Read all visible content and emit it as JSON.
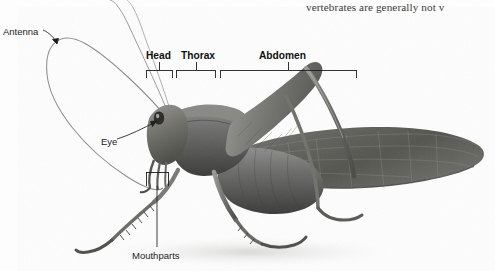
{
  "figure": {
    "background_color": "#fefefe",
    "ink_color": "#1d1d1d"
  },
  "caption": {
    "text": "vertebrates are generally not v",
    "note_clipped_right_edge": true
  },
  "labels": {
    "antenna": "Antenna",
    "eye": "Eye",
    "mouthparts": "Mouthparts",
    "head": "Head",
    "thorax": "Thorax",
    "abdomen": "Abdomen"
  },
  "brackets": [
    {
      "name": "head",
      "label": "Head",
      "x_start": 146,
      "x_end": 172,
      "y": 70,
      "tick_x": 159
    },
    {
      "name": "thorax",
      "label": "Thorax",
      "x_start": 176,
      "x_end": 215,
      "y": 70,
      "tick_x": 196
    },
    {
      "name": "abdomen",
      "label": "Abdomen",
      "x_start": 220,
      "x_end": 356,
      "y": 70,
      "tick_x": 288
    },
    {
      "name": "mouthparts-region",
      "label": "",
      "x_start": 146,
      "x_end": 168,
      "y": 172,
      "tick_x": 157
    }
  ],
  "leaders": [
    {
      "name": "antenna-arrow",
      "from_x": 44,
      "from_y": 30,
      "to_x": 56,
      "to_y": 42,
      "arrow": true
    },
    {
      "name": "eye-leader",
      "from_x": 118,
      "from_y": 136,
      "to_x": 156,
      "to_y": 120,
      "arrow": true
    },
    {
      "name": "mouthparts-leader",
      "from_x": 157,
      "from_y": 186,
      "to_x": 157,
      "to_y": 247,
      "arrow": false
    }
  ]
}
